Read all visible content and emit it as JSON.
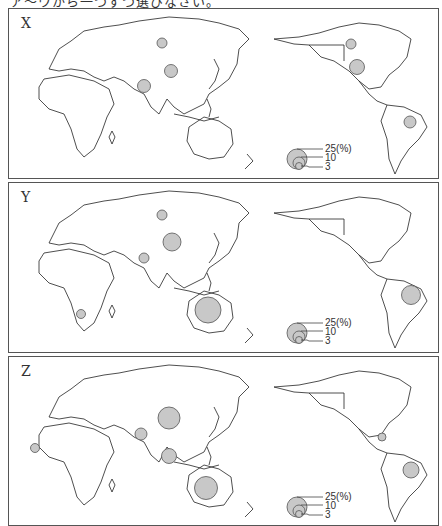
{
  "caption": "ア〜ウから一つずつ選びなさい。",
  "map_style": {
    "land_outline": "#222222",
    "circle_fill": "#c8c8c8",
    "circle_stroke": "#555555",
    "frame": "#555555"
  },
  "legend": {
    "unit": "(%)",
    "labels": [
      "25(%)",
      "10",
      "3"
    ],
    "values": [
      25,
      10,
      3
    ]
  },
  "panels": [
    {
      "label": "X",
      "circles": [
        {
          "region": "Russia",
          "x": 153,
          "y": 34,
          "r": 5
        },
        {
          "region": "China",
          "x": 162,
          "y": 62,
          "r": 6.5
        },
        {
          "region": "India",
          "x": 135,
          "y": 77,
          "r": 6.5
        },
        {
          "region": "Canada",
          "x": 342,
          "y": 35,
          "r": 5
        },
        {
          "region": "United States",
          "x": 348,
          "y": 58,
          "r": 7.5
        },
        {
          "region": "Brazil",
          "x": 401,
          "y": 113,
          "r": 6
        }
      ]
    },
    {
      "label": "Y",
      "circles": [
        {
          "region": "Russia",
          "x": 153,
          "y": 32,
          "r": 5
        },
        {
          "region": "China",
          "x": 163,
          "y": 59,
          "r": 9
        },
        {
          "region": "India",
          "x": 135,
          "y": 75,
          "r": 5
        },
        {
          "region": "South Africa",
          "x": 72,
          "y": 131,
          "r": 4.5
        },
        {
          "region": "Australia",
          "x": 199,
          "y": 127,
          "r": 13
        },
        {
          "region": "Brazil",
          "x": 402,
          "y": 112,
          "r": 9.5
        }
      ]
    },
    {
      "label": "Z",
      "circles": [
        {
          "region": "China",
          "x": 160,
          "y": 61,
          "r": 11
        },
        {
          "region": "India",
          "x": 132,
          "y": 77,
          "r": 6
        },
        {
          "region": "Guinea",
          "x": 26,
          "y": 91,
          "r": 4.5
        },
        {
          "region": "Indonesia",
          "x": 160,
          "y": 99,
          "r": 7.5
        },
        {
          "region": "Australia",
          "x": 197,
          "y": 131,
          "r": 11.5
        },
        {
          "region": "Jamaica",
          "x": 373,
          "y": 80,
          "r": 4
        },
        {
          "region": "Brazil",
          "x": 402,
          "y": 113,
          "r": 8
        }
      ]
    }
  ]
}
